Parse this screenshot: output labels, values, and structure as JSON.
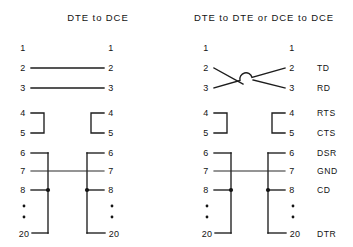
{
  "diagram": {
    "title_left": "DTE to DCE",
    "title_right": "DTE to DTE or DCE to DCE",
    "pins": {
      "p1": "1",
      "p2": "2",
      "p3": "3",
      "p4": "4",
      "p5": "5",
      "p6": "6",
      "p7": "7",
      "p8": "8",
      "p20": "20"
    },
    "signals": {
      "td": "TD",
      "rd": "RD",
      "rts": "RTS",
      "cts": "CTS",
      "dsr": "DSR",
      "gnd": "GND",
      "cd": "CD",
      "dtr": "DTR"
    },
    "colors": {
      "background": "#ffffff",
      "ink": "#1a1a1a",
      "wire": "#1d1d1d"
    },
    "panels": [
      {
        "name": "dte-to-dce",
        "title": "DTE to DCE",
        "connections": [
          {
            "left_pin": "1",
            "right_pin": "1",
            "type": "none"
          },
          {
            "left_pin": "2",
            "right_pin": "2",
            "type": "straight"
          },
          {
            "left_pin": "3",
            "right_pin": "3",
            "type": "straight"
          },
          {
            "left_pin": "4",
            "right_pin": "5",
            "type": "local-loopback"
          },
          {
            "left_pin": "7",
            "right_pin": "7",
            "type": "straight"
          },
          {
            "left_pin": "6,8,20",
            "right_pin": "6,8,20",
            "type": "local-bus"
          }
        ]
      },
      {
        "name": "dte-to-dte-or-dce-to-dce",
        "title": "DTE to DTE or DCE to DCE",
        "connections": [
          {
            "left_pin": "1",
            "right_pin": "1",
            "type": "none"
          },
          {
            "left_pin": "2",
            "right_pin": "3",
            "type": "crossover"
          },
          {
            "left_pin": "3",
            "right_pin": "2",
            "type": "crossover"
          },
          {
            "left_pin": "4",
            "right_pin": "5",
            "type": "local-loopback"
          },
          {
            "left_pin": "7",
            "right_pin": "7",
            "type": "straight"
          },
          {
            "left_pin": "6,8,20",
            "right_pin": "6,8,20",
            "type": "local-bus"
          }
        ]
      }
    ]
  }
}
